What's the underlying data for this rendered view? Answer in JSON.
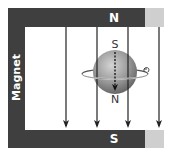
{
  "magnet": {
    "label": "Magnet",
    "top_pole": "N",
    "bottom_pole": "S",
    "body_color": "#3f3f3f",
    "end_color": "#cfcfcf"
  },
  "field_lines": {
    "count": 4,
    "direction": "down",
    "x_positions": [
      66,
      97,
      128,
      159
    ],
    "color": "#222222"
  },
  "sphere": {
    "top_label": "S",
    "bottom_label": "N",
    "axis_style": "dashed-arrow-down",
    "rotation_indicator": "ellipse-with-arrow",
    "color": "#9a9a9a"
  }
}
